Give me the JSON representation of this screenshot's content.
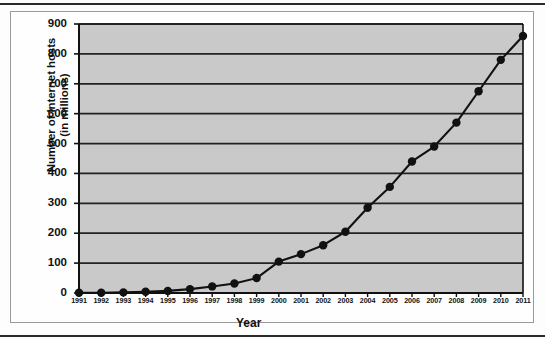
{
  "chart_data": {
    "type": "line",
    "title": "",
    "xlabel": "Year",
    "ylabel": "Number of Internet hosts (in millions)",
    "ylabel_line1": "Number of Internet hosts",
    "ylabel_line2": "(in millions)",
    "categories": [
      "1991",
      "1992",
      "1993",
      "1994",
      "1995",
      "1996",
      "1997",
      "1998",
      "1999",
      "2000",
      "2001",
      "2002",
      "2003",
      "2004",
      "2005",
      "2006",
      "2007",
      "2008",
      "2009",
      "2010",
      "2011"
    ],
    "values": [
      1,
      1,
      2,
      4,
      7,
      13,
      22,
      32,
      50,
      105,
      130,
      160,
      205,
      285,
      355,
      440,
      490,
      570,
      675,
      780,
      860
    ],
    "series": [
      {
        "name": "Internet hosts",
        "values": [
          1,
          1,
          2,
          4,
          7,
          13,
          22,
          32,
          50,
          105,
          130,
          160,
          205,
          285,
          355,
          440,
          490,
          570,
          675,
          780,
          860
        ]
      }
    ],
    "ylim": [
      0,
      900
    ],
    "yticks": [
      0,
      100,
      200,
      300,
      400,
      500,
      600,
      700,
      800,
      900
    ],
    "ytick_labels": [
      "0",
      "100",
      "200",
      "300",
      "400",
      "500",
      "600",
      "700",
      "800",
      "900"
    ],
    "grid": true,
    "grid_axis": "y",
    "legend": false,
    "legend_position": "none",
    "marker": "circle",
    "colors": {
      "plot_background": "#c9c9c9",
      "line": "#111111",
      "marker": "#111111",
      "gridline": "#222222",
      "axis": "#111111",
      "page_background": "#ffffff"
    }
  }
}
